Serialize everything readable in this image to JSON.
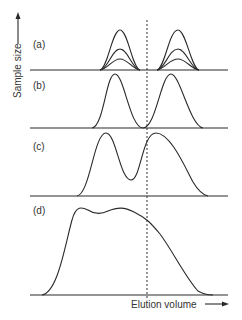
{
  "figure": {
    "y_axis_label": "Sample size",
    "x_axis_label": "Elution volume",
    "panels": [
      {
        "label": "(a)",
        "description": "Two well-separated peaks, three increasing sample sizes"
      },
      {
        "label": "(b)",
        "description": "Two peaks touching at baseline"
      },
      {
        "label": "(c)",
        "description": "Two overlapping peaks with valley"
      },
      {
        "label": "(d)",
        "description": "Merged broad peak with shoulder"
      }
    ],
    "dashed_line": "fraction cut point"
  }
}
